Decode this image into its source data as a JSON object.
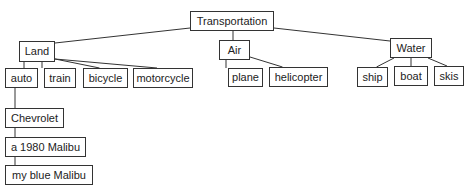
{
  "diagram": {
    "type": "tree",
    "root": "Transportation",
    "nodes": {
      "transportation": "Transportation",
      "land": "Land",
      "air": "Air",
      "water": "Water",
      "auto": "auto",
      "train": "train",
      "bicycle": "bicycle",
      "motorcycle": "motorcycle",
      "plane": "plane",
      "helicopter": "helicopter",
      "ship": "ship",
      "boat": "boat",
      "skis": "skis",
      "chevrolet": "Chevrolet",
      "malibu_1980": "a 1980 Malibu",
      "my_blue_malibu": "my blue Malibu"
    },
    "edges": [
      [
        "transportation",
        "land"
      ],
      [
        "transportation",
        "air"
      ],
      [
        "transportation",
        "water"
      ],
      [
        "land",
        "auto"
      ],
      [
        "land",
        "train"
      ],
      [
        "land",
        "bicycle"
      ],
      [
        "land",
        "motorcycle"
      ],
      [
        "air",
        "plane"
      ],
      [
        "air",
        "helicopter"
      ],
      [
        "water",
        "ship"
      ],
      [
        "water",
        "boat"
      ],
      [
        "water",
        "skis"
      ],
      [
        "auto",
        "chevrolet"
      ],
      [
        "chevrolet",
        "malibu_1980"
      ],
      [
        "malibu_1980",
        "my_blue_malibu"
      ]
    ]
  }
}
